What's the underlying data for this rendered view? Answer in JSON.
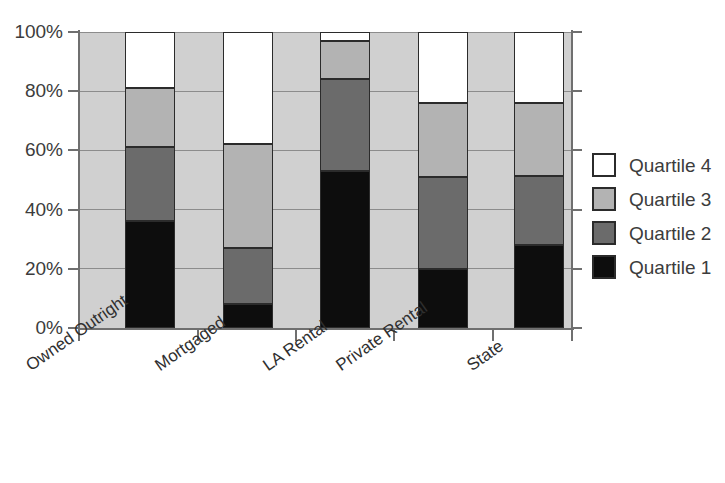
{
  "chart_data": {
    "type": "bar",
    "subtype": "stacked-100-percent",
    "title": "",
    "xlabel": "",
    "ylabel": "",
    "ylim": [
      0,
      100
    ],
    "yticks": [
      "0%",
      "20%",
      "40%",
      "60%",
      "80%",
      "100%"
    ],
    "ytick_values": [
      0,
      20,
      40,
      60,
      80,
      100
    ],
    "grid": true,
    "legend_position": "right",
    "categories": [
      "Owned Outright",
      "Mortgaged",
      "LA Rental",
      "Private Rental",
      "State"
    ],
    "series": [
      {
        "name": "Quartile 1",
        "color": "#0d0d0d",
        "values": [
          36,
          8,
          53,
          20,
          28
        ]
      },
      {
        "name": "Quartile 2",
        "color": "#6b6b6b",
        "values": [
          25,
          19,
          31,
          31,
          23.5
        ]
      },
      {
        "name": "Quartile 3",
        "color": "#b3b3b3",
        "values": [
          20,
          35,
          13,
          25,
          24.5
        ]
      },
      {
        "name": "Quartile 4",
        "color": "#ffffff",
        "values": [
          19,
          38,
          3,
          24,
          24
        ]
      }
    ],
    "cumulative_tops": {
      "Owned Outright": [
        36,
        61,
        81,
        100
      ],
      "Mortgaged": [
        8,
        27,
        62,
        100
      ],
      "LA Rental": [
        53,
        84,
        97,
        100
      ],
      "Private Rental": [
        20,
        51,
        76,
        100
      ],
      "State": [
        28,
        51.5,
        76,
        100
      ]
    }
  },
  "legend": {
    "items": [
      {
        "label": "Quartile 4",
        "swatch": "q4"
      },
      {
        "label": "Quartile 3",
        "swatch": "q3"
      },
      {
        "label": "Quartile 2",
        "swatch": "q2"
      },
      {
        "label": "Quartile 1",
        "swatch": "q1"
      }
    ]
  },
  "caption": "",
  "colors": {
    "quartile1": "#0d0d0d",
    "quartile2": "#6b6b6b",
    "quartile3": "#b3b3b3",
    "quartile4": "#ffffff",
    "plot_background": "#d0d0d0",
    "axis": "#6f6f6f",
    "gridline": "#8c8c8c"
  }
}
